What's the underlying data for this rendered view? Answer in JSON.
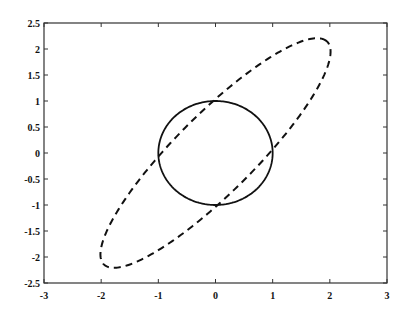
{
  "chart_data": {
    "type": "line",
    "title": "",
    "xlabel": "",
    "ylabel": "",
    "xlim": [
      -3,
      3
    ],
    "ylim": [
      -2.5,
      2.5
    ],
    "grid": false,
    "legend": null,
    "x_ticks": [
      "-3",
      "-2",
      "-1",
      "0",
      "1",
      "2",
      "3"
    ],
    "y_ticks": [
      "2.5",
      "2",
      "1.5",
      "1",
      "0.5",
      "0",
      "-0.5",
      "-1",
      "-1.5",
      "-2",
      "-2.5"
    ],
    "series": [
      {
        "name": "unit circle",
        "style": "solid",
        "shape": "circle",
        "center": [
          0,
          0
        ],
        "radius": 1
      },
      {
        "name": "rotated ellipse",
        "style": "dashed",
        "shape": "ellipse",
        "center": [
          0,
          0
        ],
        "semi_major": 2.9,
        "semi_minor": 0.72,
        "rotation_deg": 48,
        "approx_points": [
          [
            1.85,
            2.2
          ],
          [
            2.25,
            1.9
          ],
          [
            -1.85,
            -2.2
          ],
          [
            -2.25,
            -1.9
          ],
          [
            -0.7,
            0.7
          ],
          [
            0.7,
            -0.7
          ]
        ]
      }
    ]
  }
}
